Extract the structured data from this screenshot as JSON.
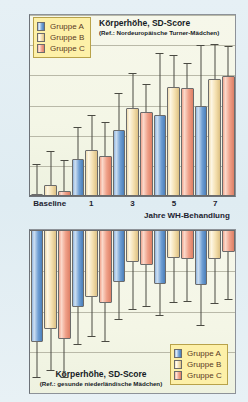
{
  "legend": {
    "items": [
      {
        "label": "Gruppe A",
        "key": "A",
        "color": "#6f9fd4"
      },
      {
        "label": "Gruppe B",
        "key": "B",
        "color": "#f4dfae"
      },
      {
        "label": "Gruppe C",
        "key": "C",
        "color": "#ef9f87"
      }
    ]
  },
  "top_chart": {
    "title_line1": "Körperhöhe, SD-Score",
    "title_line2": "(Ref.: Nordeuropäische Turner-Mädchen)",
    "xaxis_title": "Jahre WH-Behandlung",
    "yticks": [
      "6",
      "5",
      "4",
      "3",
      "2",
      "1",
      "0"
    ],
    "xlabels": [
      "Baseline",
      "1",
      "3",
      "5",
      "7"
    ]
  },
  "bottom_chart": {
    "title_line1": "Körperhöhe, SD-Score",
    "title_line2": "(Ref.: gesunde niederländische Mädchen)",
    "yticks": [
      "0",
      "-1",
      "-2",
      "-3",
      "-4"
    ]
  },
  "chart_data": [
    {
      "id": "top",
      "type": "bar",
      "title": "Körperhöhe, SD-Score",
      "subtitle": "(Ref.: Nordeuropäische Turner-Mädchen)",
      "xlabel": "Jahre WH-Behandlung",
      "ylabel": "SD-Score",
      "ylim": [
        0,
        6
      ],
      "yticks": [
        0,
        1,
        2,
        3,
        4,
        5,
        6
      ],
      "grid": true,
      "legend_position": "top-left",
      "reference": "Nordeuropäische Turner-Mädchen",
      "categories": [
        "Baseline",
        "1",
        "3",
        "5",
        "7"
      ],
      "series": [
        {
          "name": "Gruppe A",
          "color": "#6f9fd4",
          "values": [
            0.08,
            1.22,
            2.18,
            2.67,
            2.98
          ],
          "err_upper": [
            1.05,
            2.3,
            3.4,
            4.75,
            5.0
          ],
          "err_lower": [
            0.08,
            1.22,
            2.18,
            2.67,
            2.98
          ]
        },
        {
          "name": "Gruppe B",
          "color": "#f4dfae",
          "values": [
            0.38,
            1.52,
            2.92,
            3.6,
            3.88
          ],
          "err_upper": [
            1.48,
            2.68,
            4.08,
            4.68,
            5.05
          ],
          "err_lower": [
            0.38,
            1.52,
            2.92,
            3.6,
            3.88
          ]
        },
        {
          "name": "Gruppe C",
          "color": "#ef9f87",
          "values": [
            0.15,
            1.34,
            2.78,
            3.57,
            3.97
          ],
          "err_upper": [
            1.2,
            2.45,
            3.7,
            4.4,
            4.98
          ],
          "err_lower": [
            0.15,
            1.34,
            2.78,
            3.57,
            3.97
          ]
        }
      ]
    },
    {
      "id": "bottom",
      "type": "bar",
      "title": "Körperhöhe, SD-Score",
      "subtitle": "(Ref.: gesunde niederländische Mädchen)",
      "xlabel": "",
      "ylabel": "SD-Score",
      "ylim": [
        -4,
        0
      ],
      "yticks": [
        0,
        -1,
        -2,
        -3,
        -4
      ],
      "grid": true,
      "legend_position": "bottom-right",
      "reference": "gesunde niederländische Mädchen",
      "categories": [
        "Baseline",
        "1",
        "3",
        "5",
        "7"
      ],
      "series": [
        {
          "name": "Gruppe A",
          "color": "#6f9fd4",
          "values": [
            -2.75,
            -1.9,
            -1.27,
            -1.33,
            -1.35
          ],
          "err_lower": [
            -3.62,
            -2.83,
            -2.22,
            -2.1,
            -2.35
          ],
          "err_upper": [
            -2.75,
            -1.9,
            -1.27,
            -1.33,
            -1.35
          ]
        },
        {
          "name": "Gruppe B",
          "color": "#f4dfae",
          "values": [
            -2.42,
            -1.65,
            -0.78,
            -0.68,
            -0.7
          ],
          "err_lower": [
            -3.45,
            -2.62,
            -1.97,
            -1.8,
            -1.82
          ],
          "err_upper": [
            -2.42,
            -1.65,
            -0.78,
            -0.68,
            -0.7
          ]
        },
        {
          "name": "Gruppe C",
          "color": "#ef9f87",
          "values": [
            -2.68,
            -1.8,
            -0.87,
            -0.72,
            -0.55
          ],
          "err_lower": [
            -3.62,
            -2.75,
            -1.88,
            -1.77,
            -1.73
          ],
          "err_upper": [
            -2.68,
            -1.8,
            -0.87,
            -0.72,
            -0.55
          ]
        }
      ]
    }
  ]
}
